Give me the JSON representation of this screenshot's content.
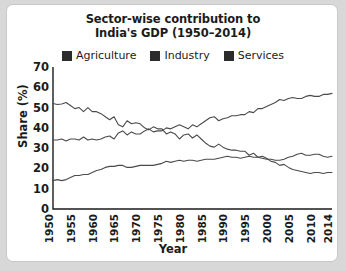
{
  "card": {
    "title_line1": "Sector-wise contribution to",
    "title_line2": "India's GDP (1950–2014)"
  },
  "legend": {
    "items": [
      {
        "label": "Agriculture",
        "swatch": "legend-swatch-dark"
      },
      {
        "label": "Industry",
        "swatch": "legend-swatch-dark"
      },
      {
        "label": "Services",
        "swatch": "legend-swatch-dark"
      }
    ]
  },
  "axes": {
    "ylabel": "Share (%)",
    "xlabel": "Year",
    "yticks": [
      "70",
      "60",
      "50",
      "40",
      "30",
      "20",
      "10",
      "0"
    ],
    "xticks": [
      "1950",
      "1955",
      "1960",
      "1965",
      "1970",
      "1975",
      "1980",
      "1985",
      "1990",
      "1995",
      "2000",
      "2005",
      "2010",
      "2014"
    ]
  },
  "colors": {
    "line": "#4a4a4a",
    "axis": "#1b1b1b",
    "text": "#1b1b1b",
    "swatch": "#2b2b2b",
    "card_bg": "#ffffff",
    "card_border": "#c9c9c9",
    "page_bg": "#d8d8d8"
  },
  "chart_data": {
    "type": "line",
    "title": "Sector-wise contribution to India's GDP (1950–2014)",
    "xlabel": "Year",
    "ylabel": "Share (%)",
    "xlim": [
      1950,
      2014
    ],
    "ylim": [
      0,
      70
    ],
    "ytick_step": 10,
    "xtick_step": 5,
    "grid": false,
    "legend_position": "top",
    "x": [
      1950,
      1951,
      1952,
      1953,
      1954,
      1955,
      1956,
      1957,
      1958,
      1959,
      1960,
      1961,
      1962,
      1963,
      1964,
      1965,
      1966,
      1967,
      1968,
      1969,
      1970,
      1971,
      1972,
      1973,
      1974,
      1975,
      1976,
      1977,
      1978,
      1979,
      1980,
      1981,
      1982,
      1983,
      1984,
      1985,
      1986,
      1987,
      1988,
      1989,
      1990,
      1991,
      1992,
      1993,
      1994,
      1995,
      1996,
      1997,
      1998,
      1999,
      2000,
      2001,
      2002,
      2003,
      2004,
      2005,
      2006,
      2007,
      2008,
      2009,
      2010,
      2011,
      2012,
      2013,
      2014
    ],
    "series": [
      {
        "name": "Agriculture",
        "values": [
          52.0,
          51.5,
          51.8,
          52.5,
          51.0,
          49.5,
          50.0,
          48.0,
          50.0,
          48.0,
          48.0,
          47.0,
          45.5,
          44.0,
          45.5,
          41.5,
          40.5,
          43.5,
          42.0,
          42.5,
          42.0,
          40.0,
          39.0,
          40.5,
          39.5,
          39.5,
          37.0,
          38.0,
          37.0,
          34.5,
          36.5,
          37.0,
          35.0,
          36.5,
          34.5,
          32.5,
          31.0,
          30.5,
          32.0,
          30.5,
          29.5,
          29.0,
          29.0,
          28.5,
          28.5,
          26.5,
          27.5,
          25.5,
          26.0,
          25.0,
          23.5,
          23.0,
          21.5,
          22.0,
          20.5,
          19.5,
          19.0,
          18.5,
          18.0,
          17.5,
          18.0,
          18.0,
          17.5,
          18.0,
          18.0
        ]
      },
      {
        "name": "Industry",
        "values": [
          14.0,
          14.5,
          14.0,
          14.5,
          15.5,
          16.5,
          16.5,
          17.0,
          17.0,
          18.0,
          19.0,
          19.5,
          20.5,
          21.0,
          21.0,
          21.5,
          21.5,
          20.5,
          20.5,
          21.0,
          21.5,
          21.5,
          21.5,
          21.5,
          22.0,
          22.5,
          23.5,
          23.0,
          23.5,
          24.0,
          23.5,
          24.0,
          24.0,
          23.5,
          24.0,
          24.5,
          24.5,
          24.5,
          25.0,
          25.5,
          26.0,
          25.5,
          25.5,
          25.0,
          25.5,
          26.0,
          25.5,
          25.5,
          25.0,
          24.5,
          24.5,
          24.0,
          24.0,
          24.5,
          25.5,
          26.0,
          27.0,
          27.5,
          26.5,
          26.5,
          27.0,
          27.0,
          26.0,
          25.5,
          26.0
        ]
      },
      {
        "name": "Services",
        "values": [
          34.0,
          34.0,
          34.5,
          33.5,
          34.5,
          34.5,
          34.0,
          35.5,
          34.0,
          34.5,
          34.0,
          34.5,
          35.5,
          36.0,
          34.5,
          37.5,
          38.5,
          36.5,
          38.0,
          37.0,
          37.0,
          38.5,
          39.5,
          38.0,
          38.5,
          38.5,
          40.0,
          39.5,
          40.5,
          41.5,
          40.5,
          39.5,
          41.5,
          40.5,
          42.0,
          43.5,
          45.0,
          45.5,
          43.5,
          44.5,
          45.0,
          46.0,
          46.0,
          46.5,
          46.5,
          48.0,
          47.5,
          49.5,
          49.5,
          50.5,
          51.5,
          52.5,
          54.0,
          53.5,
          54.5,
          55.0,
          54.5,
          54.5,
          55.5,
          56.0,
          55.5,
          55.5,
          56.5,
          56.5,
          57.0
        ]
      }
    ]
  }
}
